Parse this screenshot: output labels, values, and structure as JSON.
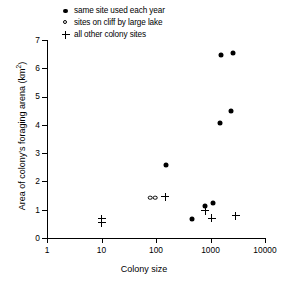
{
  "chart_data": {
    "type": "scatter",
    "title": "",
    "xlabel": "Colony size",
    "ylabel": "Area of colony's foraging arena (km2)",
    "ylabel_base": "Area of colony's foraging arena (km",
    "ylabel_sup": "2",
    "ylabel_tail": ")",
    "xscale": "log",
    "yscale": "linear",
    "xlim": [
      1,
      10000
    ],
    "ylim": [
      0,
      7
    ],
    "xticks": [
      1,
      10,
      100,
      1000,
      10000
    ],
    "xtick_labels": [
      "1",
      "10",
      "100",
      "1000",
      "10000"
    ],
    "yticks": [
      0,
      1,
      2,
      3,
      4,
      5,
      6,
      7
    ],
    "ytick_labels": [
      "0",
      "1",
      "2",
      "3",
      "4",
      "5",
      "6",
      "7"
    ],
    "grid": false,
    "legend_position": "top-left-above-axes",
    "series": [
      {
        "name": "same site used each year",
        "marker": "filled-circle",
        "color": "#000000",
        "points": [
          {
            "x": 150,
            "y": 2.58
          },
          {
            "x": 450,
            "y": 0.68
          },
          {
            "x": 780,
            "y": 1.12
          },
          {
            "x": 1100,
            "y": 1.23
          },
          {
            "x": 1500,
            "y": 4.08
          },
          {
            "x": 1550,
            "y": 6.47
          },
          {
            "x": 2400,
            "y": 4.5
          },
          {
            "x": 2550,
            "y": 6.55
          }
        ]
      },
      {
        "name": "sites on cliff by large lake",
        "marker": "open-circle",
        "color": "#000000",
        "points": [
          {
            "x": 78,
            "y": 1.43
          },
          {
            "x": 96,
            "y": 1.43
          }
        ]
      },
      {
        "name": "all other colony sites",
        "marker": "plus",
        "color": "#000000",
        "points": [
          {
            "x": 10,
            "y": 0.68
          },
          {
            "x": 10,
            "y": 0.54
          },
          {
            "x": 148,
            "y": 1.46
          },
          {
            "x": 800,
            "y": 0.97
          },
          {
            "x": 1050,
            "y": 0.69
          },
          {
            "x": 2900,
            "y": 0.78
          }
        ]
      }
    ]
  },
  "legend": {
    "items": [
      {
        "marker": "filled-circle",
        "label": "same site used each year"
      },
      {
        "marker": "open-circle",
        "label": "sites on cliff by large lake"
      },
      {
        "marker": "plus",
        "label": "all other colony sites"
      }
    ]
  }
}
